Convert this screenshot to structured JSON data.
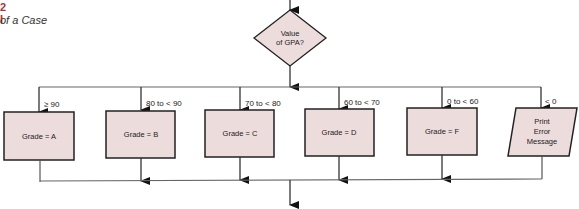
{
  "caption": {
    "figure_number": "2 I",
    "title": "of a Case"
  },
  "decision": {
    "lines": [
      "Value",
      "of GPA?"
    ]
  },
  "branches": [
    {
      "condition": "≥ 90",
      "shape": "process",
      "lines": [
        "Grade = A"
      ]
    },
    {
      "condition": "80 to < 90",
      "shape": "process",
      "lines": [
        "Grade = B"
      ]
    },
    {
      "condition": "70 to < 80",
      "shape": "process",
      "lines": [
        "Grade = C"
      ]
    },
    {
      "condition": "60 to < 70",
      "shape": "process",
      "lines": [
        "Grade = D"
      ]
    },
    {
      "condition": "0  to < 60",
      "shape": "process",
      "lines": [
        "Grade = F"
      ]
    },
    {
      "condition": "< 0",
      "shape": "io",
      "lines": [
        "Print",
        "Error",
        "Message"
      ]
    }
  ],
  "colors": {
    "box_fill": "#eddcdc",
    "stroke": "#222222",
    "line": "#555555",
    "accent": "#b0313a"
  }
}
